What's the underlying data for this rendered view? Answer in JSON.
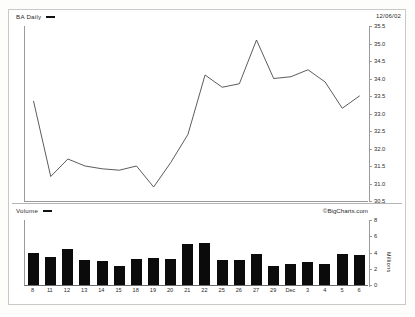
{
  "price_panel": {
    "series_label": "BA Daily",
    "quote_date": "12/06/02"
  },
  "volume_panel": {
    "series_label": "Volume",
    "watermark": "©BigCharts.com",
    "axis_unit": "Millions"
  },
  "chart_data": [
    {
      "type": "line",
      "title": "BA Daily",
      "xlabel": "",
      "ylabel": "",
      "ylim": [
        30.5,
        35.5
      ],
      "grid": false,
      "legend": "BA Daily",
      "y_ticks": [
        "35.5",
        "35.0",
        "34.5",
        "34.0",
        "33.5",
        "33.0",
        "32.5",
        "32.0",
        "31.5",
        "31.0",
        "30.5"
      ],
      "categories": [
        "8",
        "11",
        "12",
        "13",
        "14",
        "15",
        "18",
        "19",
        "20",
        "21",
        "22",
        "25",
        "26",
        "27",
        "29",
        "Dec",
        "3",
        "4",
        "5",
        "6"
      ],
      "values": [
        33.35,
        31.2,
        31.7,
        31.5,
        31.42,
        31.38,
        31.5,
        30.9,
        31.6,
        32.4,
        34.1,
        33.75,
        33.85,
        35.1,
        34.0,
        34.05,
        34.25,
        33.9,
        33.15,
        33.5
      ]
    },
    {
      "type": "bar",
      "title": "Volume",
      "xlabel": "",
      "ylabel": "Millions",
      "ylim": [
        0,
        8
      ],
      "grid": false,
      "y_ticks": [
        "8",
        "6",
        "4",
        "2",
        "0"
      ],
      "categories": [
        "8",
        "11",
        "12",
        "13",
        "14",
        "15",
        "18",
        "19",
        "20",
        "21",
        "22",
        "25",
        "26",
        "27",
        "29",
        "Dec",
        "3",
        "4",
        "5",
        "6"
      ],
      "values": [
        3.9,
        3.4,
        4.4,
        3.1,
        2.9,
        2.4,
        3.2,
        3.3,
        3.2,
        5.1,
        5.2,
        3.1,
        3.1,
        3.8,
        2.3,
        2.6,
        2.8,
        2.6,
        3.8,
        3.7
      ]
    }
  ]
}
